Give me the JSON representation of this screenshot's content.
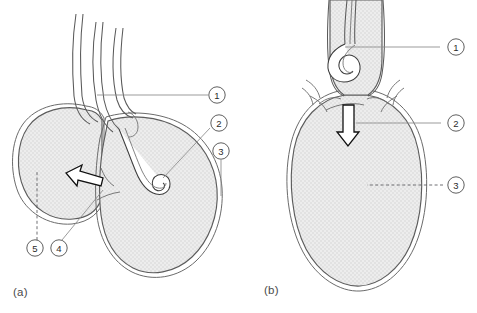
{
  "figure": {
    "type": "anatomical-line-diagram",
    "background_color": "#ffffff",
    "fill_color": "#e8e8e8",
    "outline_color": "#5c5c5c",
    "callout_text_color": "#2b2b2b",
    "leader_color": "#8a8a8a"
  },
  "panels": [
    {
      "id": "a",
      "caption": "(a)",
      "callouts": [
        {
          "id": "a1",
          "label": "1"
        },
        {
          "id": "a2",
          "label": "2"
        },
        {
          "id": "a3",
          "label": "3"
        },
        {
          "id": "a4",
          "label": "4"
        },
        {
          "id": "a5",
          "label": "5"
        }
      ]
    },
    {
      "id": "b",
      "caption": "(b)",
      "callouts": [
        {
          "id": "b1",
          "label": "1"
        },
        {
          "id": "b2",
          "label": "2"
        },
        {
          "id": "b3",
          "label": "3"
        }
      ]
    }
  ],
  "callout_labels": {
    "a1": "1",
    "a2": "2",
    "a3": "3",
    "a4": "4",
    "a5": "5",
    "b1": "1",
    "b2": "2",
    "b3": "3"
  },
  "captions": {
    "panel_a": "(a)",
    "panel_b": "(b)"
  }
}
